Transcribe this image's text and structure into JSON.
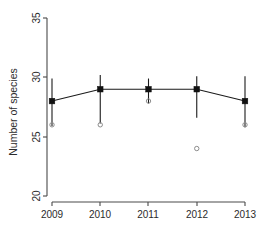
{
  "chart_data": {
    "type": "line",
    "title": "",
    "xlabel": "",
    "ylabel": "Number of species",
    "x": [
      2009,
      2010,
      2011,
      2012,
      2013
    ],
    "xtick_labels": [
      "2009",
      "2010",
      "2011",
      "2012",
      "2013"
    ],
    "ytick_labels": [
      "20",
      "25",
      "30",
      "35"
    ],
    "yticks": [
      20,
      25,
      30,
      35
    ],
    "ylim": [
      20,
      35
    ],
    "xlim": [
      2008.72,
      2013.28
    ],
    "grid": false,
    "legend": null,
    "series": [
      {
        "name": "mean number of species",
        "marker": "filled-square",
        "values": [
          28.0,
          29.0,
          29.0,
          29.0,
          28.0
        ],
        "error_low": [
          25.9,
          26.1,
          27.8,
          26.6,
          25.8
        ],
        "error_high": [
          29.9,
          30.2,
          29.9,
          30.1,
          30.1
        ]
      },
      {
        "name": "observed points",
        "marker": "open-circle",
        "values": [
          26.0,
          26.0,
          28.0,
          24.0,
          26.0
        ]
      }
    ]
  },
  "axes": {
    "y_label": "Number of species"
  }
}
